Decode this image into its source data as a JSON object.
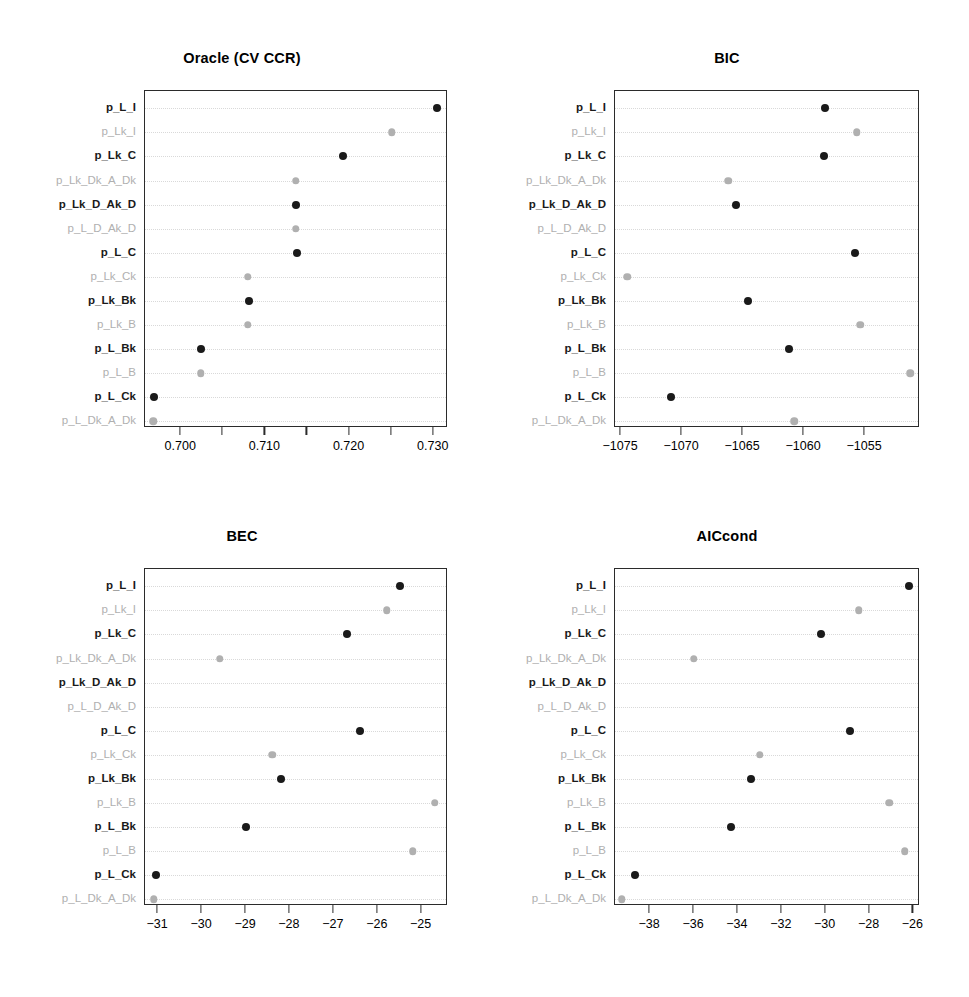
{
  "figure": {
    "background": "#ffffff",
    "dark_color": "#1a1a1a",
    "light_color": "#b0b0b0",
    "grid_color": "#d9d9d9",
    "axis_color": "#2b2b2b"
  },
  "row_labels": [
    "p_L_I",
    "p_Lk_I",
    "p_Lk_C",
    "p_Lk_Dk_A_Dk",
    "p_Lk_D_Ak_D",
    "p_L_D_Ak_D",
    "p_L_C",
    "p_Lk_Ck",
    "p_Lk_Bk",
    "p_Lk_B",
    "p_L_Bk",
    "p_L_B",
    "p_L_Ck",
    "p_L_Dk_A_Dk"
  ],
  "row_shades": [
    "dark",
    "light",
    "dark",
    "light",
    "dark",
    "light",
    "dark",
    "light",
    "dark",
    "light",
    "dark",
    "light",
    "dark",
    "light"
  ],
  "chart_data": [
    {
      "type": "scatter",
      "panel": "top-left",
      "title": "Oracle (CV CCR)",
      "xlabel": "",
      "ylabel": "",
      "grid": true,
      "legend": "none",
      "xlim": [
        0.6957,
        0.7317
      ],
      "xticks": [
        0.7,
        0.705,
        0.71,
        0.715,
        0.72,
        0.725,
        0.73
      ],
      "xticklabels": [
        "0.700",
        "",
        "0.710",
        "",
        "0.720",
        "",
        "0.730"
      ],
      "categories": [
        "p_L_I",
        "p_Lk_I",
        "p_Lk_C",
        "p_Lk_Dk_A_Dk",
        "p_Lk_D_Ak_D",
        "p_L_D_Ak_D",
        "p_L_C",
        "p_Lk_Ck",
        "p_Lk_Bk",
        "p_Lk_B",
        "p_L_Bk",
        "p_L_B",
        "p_L_Ck",
        "p_L_Dk_A_Dk"
      ],
      "values": [
        0.7304,
        0.725,
        0.7192,
        0.7136,
        0.7136,
        0.7136,
        0.7137,
        0.7079,
        0.708,
        0.7079,
        0.7024,
        0.7023,
        0.6968,
        0.6967
      ]
    },
    {
      "type": "scatter",
      "panel": "top-right",
      "title": "BIC",
      "xlabel": "",
      "ylabel": "",
      "grid": true,
      "legend": "none",
      "xlim": [
        -1075.5,
        -1050.5
      ],
      "xticks": [
        -1075,
        -1070,
        -1065,
        -1060,
        -1055
      ],
      "xticklabels": [
        "−1075",
        "−1070",
        "−1065",
        "−1060",
        "−1055"
      ],
      "categories": [
        "p_L_I",
        "p_Lk_I",
        "p_Lk_C",
        "p_Lk_Dk_A_Dk",
        "p_Lk_D_Ak_D",
        "p_L_D_Ak_D",
        "p_L_C",
        "p_Lk_Ck",
        "p_Lk_Bk",
        "p_Lk_B",
        "p_L_Bk",
        "p_L_B",
        "p_L_Ck",
        "p_L_Dk_A_Dk"
      ],
      "values": [
        -1058.3,
        -1055.7,
        -1058.4,
        -1066.2,
        -1065.6,
        null,
        -1055.8,
        -1074.5,
        -1064.6,
        -1055.4,
        -1061.2,
        -1051.3,
        -1070.9,
        -1060.8
      ]
    },
    {
      "type": "scatter",
      "panel": "bottom-left",
      "title": "BEC",
      "xlabel": "",
      "ylabel": "",
      "grid": true,
      "legend": "none",
      "xlim": [
        -31.3,
        -24.4
      ],
      "xticks": [
        -31,
        -30,
        -29,
        -28,
        -27,
        -26,
        -25
      ],
      "xticklabels": [
        "−31",
        "−30",
        "−29",
        "−28",
        "−27",
        "−26",
        "−25"
      ],
      "categories": [
        "p_L_I",
        "p_Lk_I",
        "p_Lk_C",
        "p_Lk_Dk_A_Dk",
        "p_Lk_D_Ak_D",
        "p_L_D_Ak_D",
        "p_L_C",
        "p_Lk_Ck",
        "p_Lk_Bk",
        "p_Lk_B",
        "p_L_Bk",
        "p_L_B",
        "p_L_Ck",
        "p_L_Dk_A_Dk"
      ],
      "values": [
        -25.5,
        -25.8,
        -26.7,
        -29.6,
        null,
        null,
        -26.4,
        -28.4,
        -28.2,
        -24.7,
        -29.0,
        -25.2,
        -31.05,
        -31.1
      ]
    },
    {
      "type": "scatter",
      "panel": "bottom-right",
      "title": "AICcond",
      "xlabel": "",
      "ylabel": "",
      "grid": true,
      "legend": "none",
      "xlim": [
        -39.6,
        -25.7
      ],
      "xticks": [
        -38,
        -36,
        -34,
        -32,
        -30,
        -28,
        -26
      ],
      "xticklabels": [
        "−38",
        "−36",
        "−34",
        "−32",
        "−30",
        "−28",
        "−26"
      ],
      "categories": [
        "p_L_I",
        "p_Lk_I",
        "p_Lk_C",
        "p_Lk_Dk_A_Dk",
        "p_Lk_D_Ak_D",
        "p_L_D_Ak_D",
        "p_L_C",
        "p_Lk_Ck",
        "p_Lk_Bk",
        "p_Lk_B",
        "p_L_Bk",
        "p_L_B",
        "p_L_Ck",
        "p_L_Dk_A_Dk"
      ],
      "values": [
        -26.2,
        -28.5,
        -30.2,
        -36.0,
        null,
        null,
        -28.9,
        -33.0,
        -33.4,
        -27.1,
        -34.3,
        -26.4,
        -38.7,
        -39.3
      ]
    }
  ]
}
